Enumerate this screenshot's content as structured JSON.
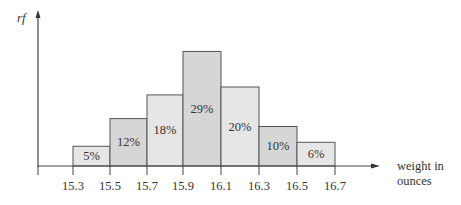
{
  "chart_data": {
    "type": "bar",
    "subtype": "histogram",
    "title": "",
    "xlabel": "weight in ounces",
    "xlabel_lines": [
      "weight in",
      "ounces"
    ],
    "ylabel": "rf",
    "bin_edges": [
      15.3,
      15.5,
      15.7,
      15.9,
      16.1,
      16.3,
      16.5,
      16.7
    ],
    "tick_labels": [
      "15.3",
      "15.5",
      "15.7",
      "15.9",
      "16.1",
      "16.3",
      "16.5",
      "16.7"
    ],
    "categories": [
      "15.3-15.5",
      "15.5-15.7",
      "15.7-15.9",
      "15.9-16.1",
      "16.1-16.3",
      "16.3-16.5",
      "16.5-16.7"
    ],
    "values": [
      5,
      12,
      18,
      29,
      20,
      10,
      6
    ],
    "value_labels": [
      "5%",
      "12%",
      "18%",
      "29%",
      "20%",
      "10%",
      "6%"
    ],
    "bar_fills": [
      "#e6e6e6",
      "#d6d6d6",
      "#e6e6e6",
      "#d6d6d6",
      "#e6e6e6",
      "#d6d6d6",
      "#e6e6e6"
    ],
    "bar_stroke": "#555555",
    "axis_color": "#444444",
    "grid": false,
    "legend": null
  }
}
